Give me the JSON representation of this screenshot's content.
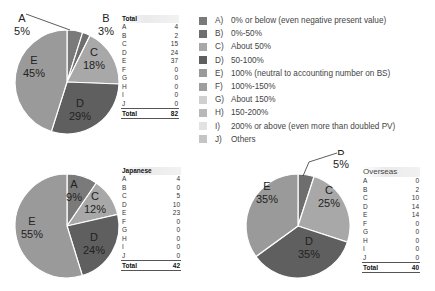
{
  "chart_data": [
    {
      "type": "pie",
      "title": "Total",
      "categories": [
        "A",
        "B",
        "C",
        "D",
        "E",
        "F",
        "G",
        "H",
        "I",
        "J"
      ],
      "values": [
        4,
        2,
        15,
        24,
        37,
        0,
        0,
        0,
        0,
        0
      ],
      "total": 82,
      "slice_labels": [
        {
          "cat": "A",
          "pct": "5%"
        },
        {
          "cat": "B",
          "pct": "3%"
        },
        {
          "cat": "C",
          "pct": "18%"
        },
        {
          "cat": "D",
          "pct": "29%"
        },
        {
          "cat": "E",
          "pct": "45%"
        }
      ]
    },
    {
      "type": "pie",
      "title": "Japanese",
      "categories": [
        "A",
        "B",
        "C",
        "D",
        "E",
        "F",
        "G",
        "H",
        "I",
        "J"
      ],
      "values": [
        4,
        0,
        5,
        10,
        23,
        0,
        0,
        0,
        0,
        0
      ],
      "total": 42,
      "slice_labels": [
        {
          "cat": "A",
          "pct": "9%"
        },
        {
          "cat": "C",
          "pct": "12%"
        },
        {
          "cat": "D",
          "pct": "24%"
        },
        {
          "cat": "E",
          "pct": "55%"
        }
      ]
    },
    {
      "type": "pie",
      "title": "Overseas",
      "categories": [
        "A",
        "B",
        "C",
        "D",
        "E",
        "F",
        "G",
        "H",
        "I",
        "J"
      ],
      "values": [
        0,
        2,
        10,
        14,
        14,
        0,
        0,
        0,
        0,
        0
      ],
      "total": 40,
      "slice_labels": [
        {
          "cat": "B",
          "pct": "5%"
        },
        {
          "cat": "C",
          "pct": "25%"
        },
        {
          "cat": "D",
          "pct": "35%"
        },
        {
          "cat": "E",
          "pct": "35%"
        }
      ]
    }
  ],
  "legend": {
    "items": [
      {
        "key": "A)",
        "label": "0% or below (even negative present value)",
        "color": "#7a7a7a"
      },
      {
        "key": "B)",
        "label": "0%-50%",
        "color": "#6e6e6e"
      },
      {
        "key": "C)",
        "label": "About 50%",
        "color": "#a8a8a8"
      },
      {
        "key": "D)",
        "label": "50-100%",
        "color": "#5f5f5f"
      },
      {
        "key": "E)",
        "label": "100% (neutral to accounting number on BS)",
        "color": "#9a9a9a"
      },
      {
        "key": "F)",
        "label": "100%-150%",
        "color": "#9e9e9e"
      },
      {
        "key": "G)",
        "label": "About 150%",
        "color": "#d0d0d0"
      },
      {
        "key": "H)",
        "label": "150-200%",
        "color": "#b8b8b8"
      },
      {
        "key": "I)",
        "label": "200% or above (even more than doubled PV)",
        "color": "#e2e2e2"
      },
      {
        "key": "J)",
        "label": "Others",
        "color": "#c4c4c4"
      }
    ]
  },
  "tables": {
    "total": {
      "header": "Total",
      "rows": [
        [
          "A",
          "4"
        ],
        [
          "B",
          "2"
        ],
        [
          "C",
          "15"
        ],
        [
          "D",
          "24"
        ],
        [
          "E",
          "37"
        ],
        [
          "F",
          "0"
        ],
        [
          "G",
          "0"
        ],
        [
          "H",
          "0"
        ],
        [
          "I",
          "0"
        ],
        [
          "J",
          "0"
        ]
      ],
      "total_label": "Total",
      "total_value": "82"
    },
    "japanese": {
      "header": "Japanese",
      "rows": [
        [
          "A",
          "4"
        ],
        [
          "B",
          "0"
        ],
        [
          "C",
          "5"
        ],
        [
          "D",
          "10"
        ],
        [
          "E",
          "23"
        ],
        [
          "F",
          "0"
        ],
        [
          "G",
          "0"
        ],
        [
          "H",
          "0"
        ],
        [
          "I",
          "0"
        ],
        [
          "J",
          "0"
        ]
      ],
      "total_label": "Total",
      "total_value": "42"
    },
    "overseas": {
      "header": "Overseas",
      "rows": [
        [
          "A",
          "0"
        ],
        [
          "B",
          "2"
        ],
        [
          "C",
          "10"
        ],
        [
          "D",
          "14"
        ],
        [
          "E",
          "14"
        ],
        [
          "F",
          "0"
        ],
        [
          "G",
          "0"
        ],
        [
          "H",
          "0"
        ],
        [
          "I",
          "0"
        ],
        [
          "J",
          "0"
        ]
      ],
      "total_label": "Total",
      "total_value": "40"
    }
  },
  "colors": {
    "A": "#7a7a7a",
    "B": "#6e6e6e",
    "C": "#a8a8a8",
    "D": "#5f5f5f",
    "E": "#9a9a9a",
    "F": "#9e9e9e",
    "G": "#d0d0d0",
    "H": "#b8b8b8",
    "I": "#e2e2e2",
    "J": "#c4c4c4",
    "slice_border": "#ffffff",
    "leader_line": "#333333"
  }
}
